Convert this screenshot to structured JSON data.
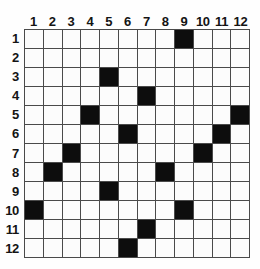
{
  "figure": {
    "name": "12x12-binary-matrix-grid",
    "rows": 12,
    "cols": 12,
    "colors": {
      "filled": "#0d0d0d",
      "empty": "#fcfcfc",
      "gridline": "#4a4a4a",
      "background": "#fefefe",
      "label": "#141414"
    }
  },
  "column_headers": [
    "1",
    "2",
    "3",
    "4",
    "5",
    "6",
    "7",
    "8",
    "9",
    "10",
    "11",
    "12"
  ],
  "row_headers": [
    "1",
    "2",
    "3",
    "4",
    "5",
    "6",
    "7",
    "8",
    "9",
    "10",
    "11",
    "12"
  ],
  "chart_data": {
    "type": "heatmap",
    "title": "",
    "xlabel": "",
    "ylabel": "",
    "categories": [
      "1",
      "2",
      "3",
      "4",
      "5",
      "6",
      "7",
      "8",
      "9",
      "10",
      "11",
      "12"
    ],
    "row_categories": [
      "1",
      "2",
      "3",
      "4",
      "5",
      "6",
      "7",
      "8",
      "9",
      "10",
      "11",
      "12"
    ],
    "grid": true,
    "legend": "none",
    "value_scale": [
      0,
      1
    ],
    "filled_cells": [
      {
        "row": 1,
        "col": 9
      },
      {
        "row": 3,
        "col": 5
      },
      {
        "row": 4,
        "col": 7
      },
      {
        "row": 5,
        "col": 4
      },
      {
        "row": 5,
        "col": 12
      },
      {
        "row": 6,
        "col": 6
      },
      {
        "row": 6,
        "col": 11
      },
      {
        "row": 7,
        "col": 3
      },
      {
        "row": 7,
        "col": 10
      },
      {
        "row": 8,
        "col": 2
      },
      {
        "row": 8,
        "col": 8
      },
      {
        "row": 9,
        "col": 5
      },
      {
        "row": 10,
        "col": 1
      },
      {
        "row": 10,
        "col": 9
      },
      {
        "row": 11,
        "col": 7
      },
      {
        "row": 12,
        "col": 6
      }
    ],
    "matrix": [
      [
        0,
        0,
        0,
        0,
        0,
        0,
        0,
        0,
        1,
        0,
        0,
        0
      ],
      [
        0,
        0,
        0,
        0,
        0,
        0,
        0,
        0,
        0,
        0,
        0,
        0
      ],
      [
        0,
        0,
        0,
        0,
        1,
        0,
        0,
        0,
        0,
        0,
        0,
        0
      ],
      [
        0,
        0,
        0,
        0,
        0,
        0,
        1,
        0,
        0,
        0,
        0,
        0
      ],
      [
        0,
        0,
        0,
        1,
        0,
        0,
        0,
        0,
        0,
        0,
        0,
        1
      ],
      [
        0,
        0,
        0,
        0,
        0,
        1,
        0,
        0,
        0,
        0,
        1,
        0
      ],
      [
        0,
        0,
        1,
        0,
        0,
        0,
        0,
        0,
        0,
        1,
        0,
        0
      ],
      [
        0,
        1,
        0,
        0,
        0,
        0,
        0,
        1,
        0,
        0,
        0,
        0
      ],
      [
        0,
        0,
        0,
        0,
        1,
        0,
        0,
        0,
        0,
        0,
        0,
        0
      ],
      [
        1,
        0,
        0,
        0,
        0,
        0,
        0,
        0,
        1,
        0,
        0,
        0
      ],
      [
        0,
        0,
        0,
        0,
        0,
        0,
        1,
        0,
        0,
        0,
        0,
        0
      ],
      [
        0,
        0,
        0,
        0,
        0,
        1,
        0,
        0,
        0,
        0,
        0,
        0
      ]
    ]
  }
}
